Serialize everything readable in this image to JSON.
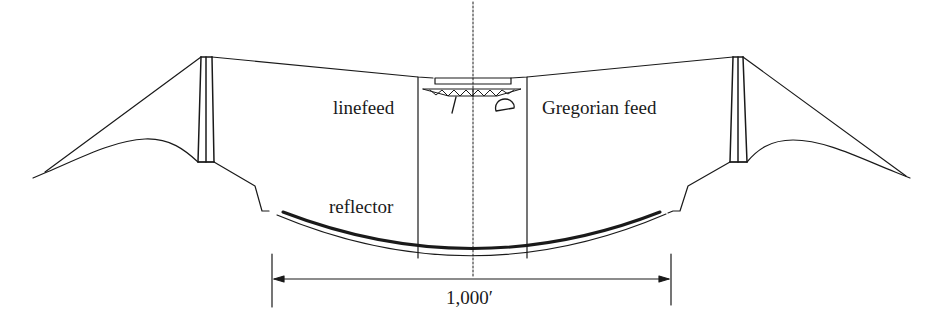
{
  "labels": {
    "linefeed": "linefeed",
    "gregorian_feed": "Gregorian feed",
    "reflector": "reflector",
    "dimension": "1,000′"
  },
  "components": [
    "left-tower",
    "right-tower",
    "support-cables",
    "feed-platform",
    "truss",
    "linefeed",
    "gregorian-dome",
    "reflector-dish",
    "ground-profile",
    "centerline",
    "dimension-line"
  ],
  "colors": {
    "stroke": "#1a1a1a",
    "background": "#ffffff"
  }
}
